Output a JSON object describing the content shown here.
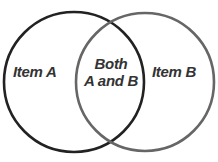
{
  "diagram": {
    "type": "venn",
    "sets": [
      {
        "id": "A",
        "label": "Item A",
        "stroke_color": "#222222",
        "center": [
          74,
          82
        ],
        "radius": 70
      },
      {
        "id": "B",
        "label": "Item B",
        "stroke_color": "#666666",
        "center": [
          145,
          82
        ],
        "radius": 69
      }
    ],
    "intersection": {
      "line1": "Both",
      "line2": "A and B"
    },
    "text_color": "#333333"
  }
}
